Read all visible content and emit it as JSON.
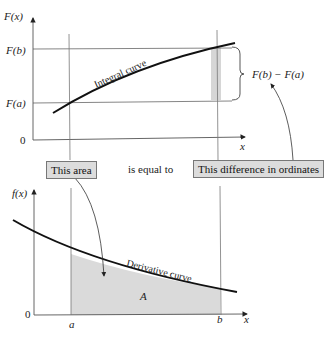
{
  "top_graph": {
    "y_axis_label": "F(x)",
    "x_axis_label": "x",
    "tick_fb": "F(b)",
    "tick_fa": "F(a)",
    "tick_zero": "0",
    "curve_label": "Integral curve",
    "difference_label": "F(b) − F(a)"
  },
  "middle": {
    "this_area": "This area",
    "is_equal_to": "is equal to",
    "this_difference": "This difference in ordinates"
  },
  "bottom_graph": {
    "y_axis_label": "f(x)",
    "x_axis_label": "x",
    "tick_zero": "0",
    "tick_a": "a",
    "tick_b": "b",
    "curve_label": "Derivative curve",
    "area_label": "A"
  },
  "colors": {
    "curve": "#111111",
    "axis": "#555555",
    "shade": "#d9d9d9",
    "box_fill": "#dcdcdc"
  }
}
